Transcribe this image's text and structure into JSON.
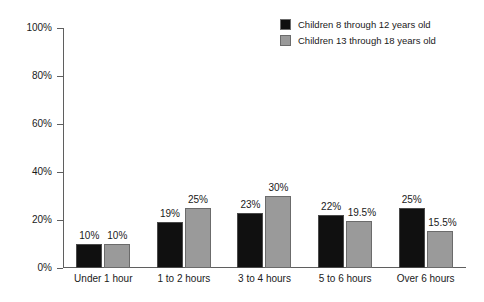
{
  "chart_data": {
    "type": "bar",
    "title": "",
    "xlabel": "",
    "ylabel": "",
    "ylim": [
      0,
      100
    ],
    "yticks": [
      "0%",
      "20%",
      "40%",
      "60%",
      "80%",
      "100%"
    ],
    "ytick_values": [
      0,
      20,
      40,
      60,
      80,
      100
    ],
    "grid": false,
    "legend_position": "top-right",
    "categories": [
      "Under 1 hour",
      "1 to 2 hours",
      "3 to 4 hours",
      "5 to 6 hours",
      "Over 6 hours"
    ],
    "series": [
      {
        "name": "Children 8 through 12 years old",
        "color": "#101010",
        "values": [
          10,
          19,
          23,
          22,
          25
        ],
        "labels": [
          "10%",
          "19%",
          "23%",
          "22%",
          "25%"
        ]
      },
      {
        "name": "Children 13 through 18 years old",
        "color": "#9a9a9a",
        "values": [
          10,
          25,
          30,
          19.5,
          15.5
        ],
        "labels": [
          "10%",
          "25%",
          "30%",
          "19.5%",
          "15.5%"
        ]
      }
    ]
  },
  "legend": {
    "items": [
      {
        "label": "Children 8 through 12 years old",
        "color": "#101010"
      },
      {
        "label": "Children 13 through 18 years old",
        "color": "#9a9a9a"
      }
    ]
  },
  "axes": {
    "y": {
      "ticks": [
        {
          "label": "100%",
          "value": 100
        },
        {
          "label": "80%",
          "value": 80
        },
        {
          "label": "60%",
          "value": 60
        },
        {
          "label": "40%",
          "value": 40
        },
        {
          "label": "20%",
          "value": 20
        },
        {
          "label": "0%",
          "value": 0
        }
      ]
    },
    "x": {
      "ticks": [
        {
          "label": "Under 1 hour"
        },
        {
          "label": "1 to 2 hours"
        },
        {
          "label": "3 to 4 hours"
        },
        {
          "label": "5 to 6 hours"
        },
        {
          "label": "Over 6 hours"
        }
      ]
    }
  }
}
